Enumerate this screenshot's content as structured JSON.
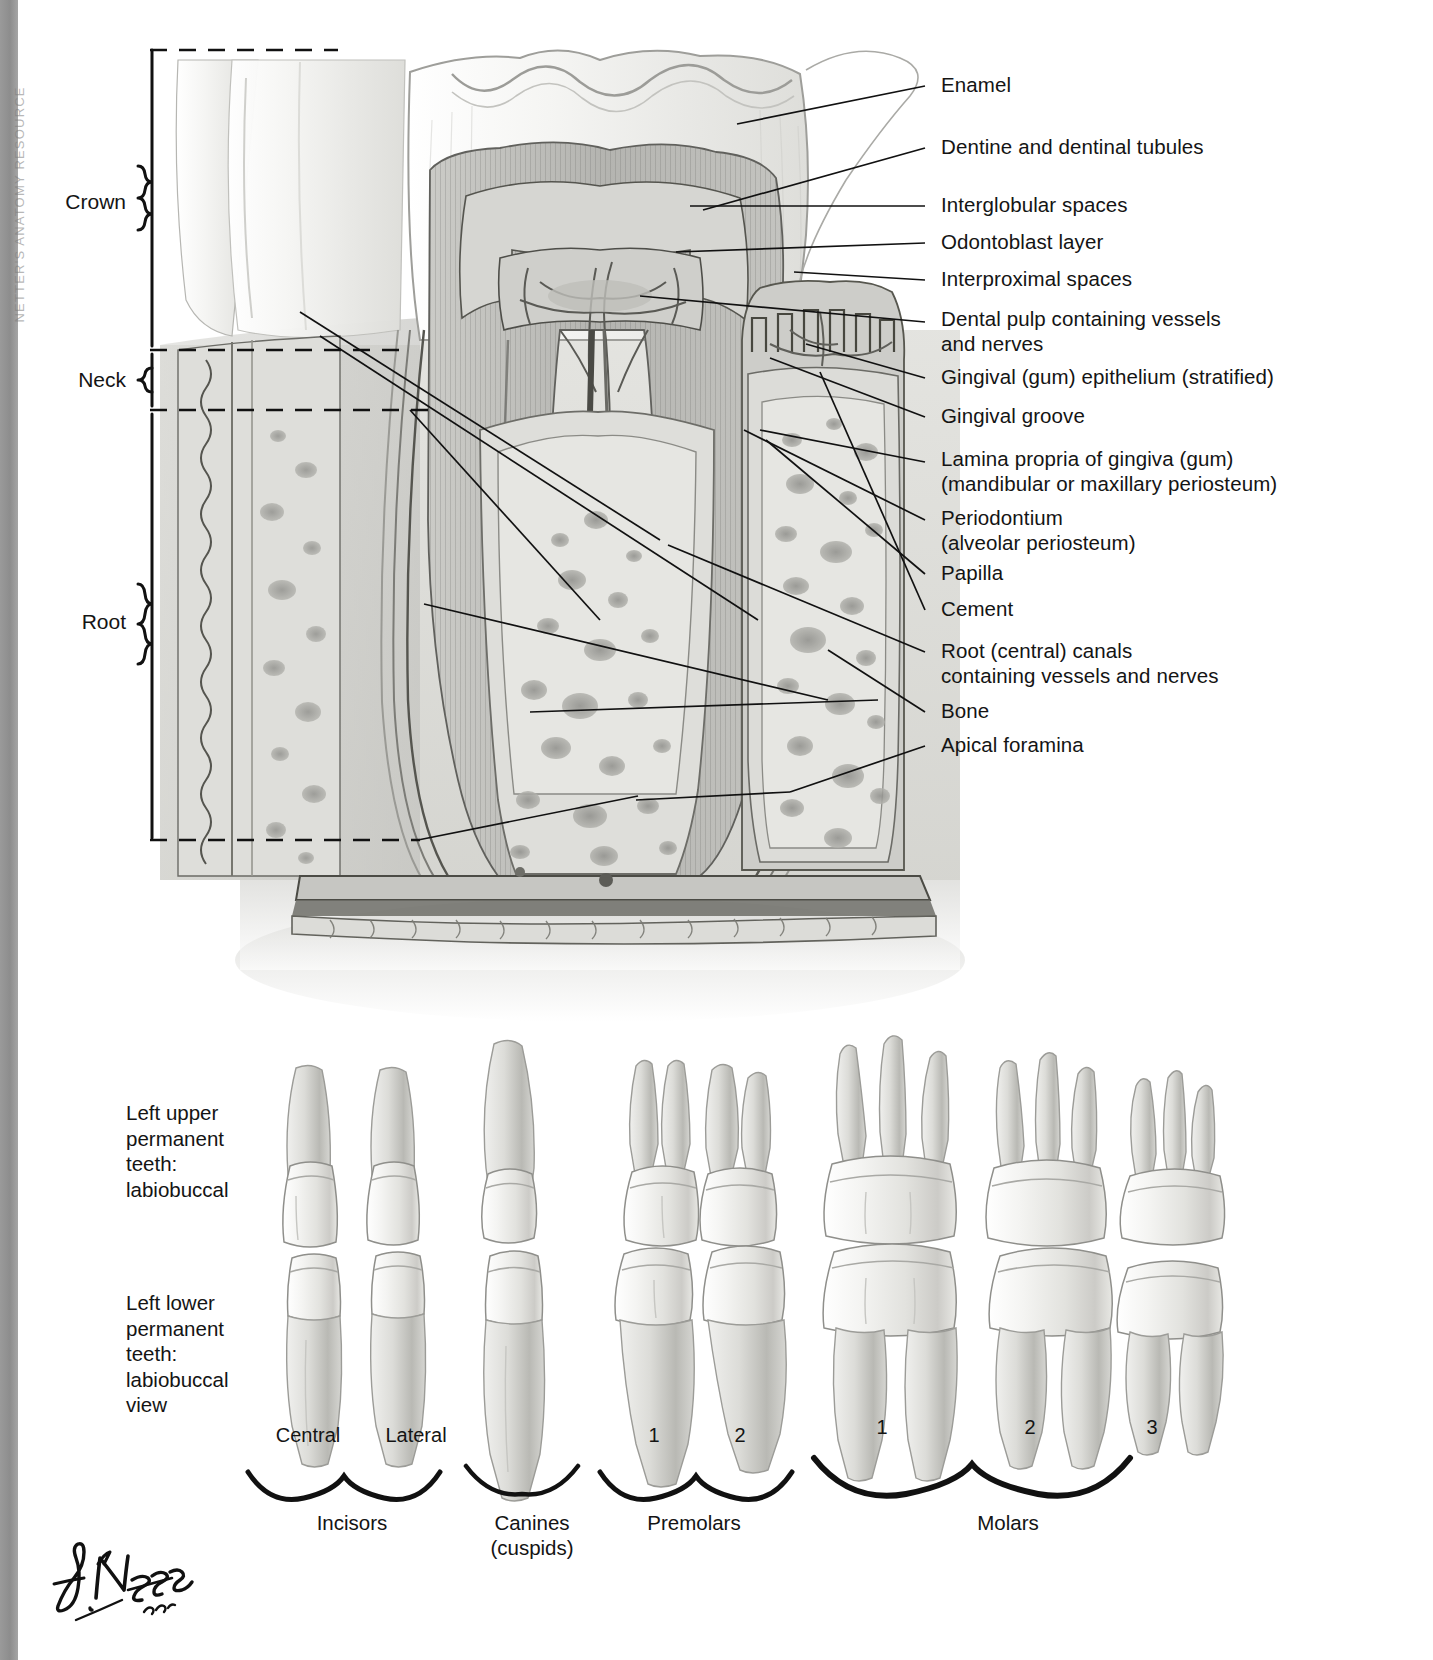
{
  "plate": {
    "margin_text": "NETTER'S ANATOMY RESOURCE",
    "signature": "F. Netter M.D."
  },
  "regions": [
    {
      "name": "crown",
      "label": "Crown"
    },
    {
      "name": "neck",
      "label": "Neck"
    },
    {
      "name": "root",
      "label": "Root"
    }
  ],
  "labels": [
    {
      "name": "enamel",
      "text": "Enamel"
    },
    {
      "name": "dentine",
      "text": "Dentine and dentinal tubules"
    },
    {
      "name": "interglobular-spaces",
      "text": "Interglobular spaces"
    },
    {
      "name": "odontoblast-layer",
      "text": "Odontoblast layer"
    },
    {
      "name": "interproximal-spaces",
      "text": "Interproximal spaces"
    },
    {
      "name": "dental-pulp",
      "text": "Dental pulp containing vessels\nand nerves"
    },
    {
      "name": "gingival-epithelium",
      "text": "Gingival (gum) epithelium (stratified)"
    },
    {
      "name": "gingival-groove",
      "text": "Gingival groove"
    },
    {
      "name": "lamina-propria",
      "text": "Lamina propria of gingiva (gum)\n(mandibular or maxillary periosteum)"
    },
    {
      "name": "periodontium",
      "text": "Periodontium\n(alveolar periosteum)"
    },
    {
      "name": "papilla",
      "text": "Papilla"
    },
    {
      "name": "cement",
      "text": "Cement"
    },
    {
      "name": "root-canals",
      "text": "Root (central) canals\ncontaining vessels and nerves"
    },
    {
      "name": "bone",
      "text": "Bone"
    },
    {
      "name": "apical-foramina",
      "text": "Apical foramina"
    }
  ],
  "rows": [
    {
      "name": "upper-row",
      "caption": "Left upper\npermanent\nteeth:\nlabiobuccal"
    },
    {
      "name": "lower-row",
      "caption": "Left lower\npermanent\nteeth:\nlabiobuccal\nview"
    }
  ],
  "tooth_positions": [
    {
      "name": "incisor-central",
      "sub": "Central"
    },
    {
      "name": "incisor-lateral",
      "sub": "Lateral"
    },
    {
      "name": "canine",
      "sub": ""
    },
    {
      "name": "premolar-1",
      "sub": "1"
    },
    {
      "name": "premolar-2",
      "sub": "2"
    },
    {
      "name": "molar-1",
      "sub": "1"
    },
    {
      "name": "molar-2",
      "sub": "2"
    },
    {
      "name": "molar-3",
      "sub": "3"
    }
  ],
  "groups": [
    {
      "name": "incisors",
      "label": "Incisors"
    },
    {
      "name": "canines",
      "label": "Canines\n(cuspids)"
    },
    {
      "name": "premolars",
      "label": "Premolars"
    },
    {
      "name": "molars",
      "label": "Molars"
    }
  ],
  "colors": {
    "margin_bar": "#8d8d8d",
    "ink": "#141414",
    "enamel": "#f2f2f0",
    "dentine": "#b9b9b6",
    "pulp": "#d8d8d4",
    "bone": "#d2d2ce",
    "gum": "#c9c9c5"
  }
}
